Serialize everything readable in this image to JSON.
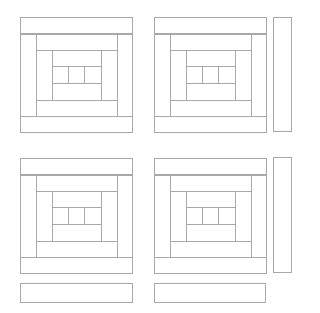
{
  "diagram": {
    "title": "",
    "line_color": "#a8a8a8",
    "background": "#ffffff",
    "blocks": [
      {
        "id": "block-1",
        "x": 20,
        "y": 17
      },
      {
        "id": "block-2",
        "x": 154,
        "y": 17
      },
      {
        "id": "block-3",
        "x": 20,
        "y": 158
      },
      {
        "id": "block-4",
        "x": 154,
        "y": 158
      }
    ],
    "block_pieces": [
      {
        "name": "outer-frame",
        "x": 0,
        "y": 0,
        "w": 113,
        "h": 116
      },
      {
        "name": "top-log-outer",
        "x": 0,
        "y": 0,
        "w": 113,
        "h": 17
      },
      {
        "name": "bottom-log-outer",
        "x": 0,
        "y": 99,
        "w": 113,
        "h": 17
      },
      {
        "name": "left-log-2",
        "x": 0,
        "y": 17,
        "w": 17,
        "h": 83
      },
      {
        "name": "right-log-2",
        "x": 97,
        "y": 17,
        "w": 16,
        "h": 83
      },
      {
        "name": "top-log-3",
        "x": 16,
        "y": 17,
        "w": 82,
        "h": 17
      },
      {
        "name": "bottom-log-3",
        "x": 16,
        "y": 83,
        "w": 82,
        "h": 17
      },
      {
        "name": "left-log-4",
        "x": 16,
        "y": 33,
        "w": 17,
        "h": 51
      },
      {
        "name": "right-log-4",
        "x": 81,
        "y": 33,
        "w": 17,
        "h": 51
      },
      {
        "name": "top-log-5",
        "x": 32,
        "y": 33,
        "w": 50,
        "h": 17
      },
      {
        "name": "bottom-log-5",
        "x": 32,
        "y": 66,
        "w": 50,
        "h": 18
      },
      {
        "name": "center-cell-1",
        "x": 32,
        "y": 49,
        "w": 17,
        "h": 18
      },
      {
        "name": "center-cell-2",
        "x": 48,
        "y": 49,
        "w": 17,
        "h": 18
      },
      {
        "name": "center-cell-3",
        "x": 64,
        "y": 49,
        "w": 18,
        "h": 18
      }
    ],
    "strips": [
      {
        "id": "vertical-strip-1",
        "x": 273,
        "y": 17,
        "w": 19,
        "h": 115
      },
      {
        "id": "vertical-strip-2",
        "x": 273,
        "y": 157,
        "w": 19,
        "h": 116
      },
      {
        "id": "horizontal-strip-1",
        "x": 20,
        "y": 283,
        "w": 113,
        "h": 20
      },
      {
        "id": "horizontal-strip-2",
        "x": 154,
        "y": 283,
        "w": 112,
        "h": 20
      }
    ]
  }
}
